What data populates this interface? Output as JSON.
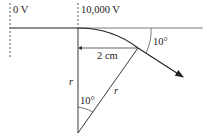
{
  "diagram": {
    "plates": {
      "left_label": "0 V",
      "right_label": "10,000 V"
    },
    "dimension_label": "2 cm",
    "exit_angle_label": "10°",
    "center_angle_label": "10°",
    "radius_label_vertical": "r",
    "radius_label_slanted": "r",
    "colors": {
      "line": "#222222",
      "dotted": "#555555",
      "background": "#ffffff"
    }
  }
}
